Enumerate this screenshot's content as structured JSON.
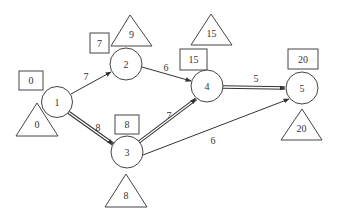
{
  "diagram": {
    "type": "activity-on-arrow network",
    "colors": {
      "line": "#333333",
      "background": "#ffffff"
    },
    "nodes": [
      {
        "id": "1",
        "label": "1",
        "cx": 57,
        "cy": 102,
        "r": 15.5,
        "early_time": "0",
        "late_time": "0",
        "box": {
          "x": 19,
          "y": 71,
          "w": 24,
          "h": 19
        },
        "tri": {
          "ax": 37,
          "ay": 103,
          "lx": 16,
          "rx": 58,
          "by": 136
        }
      },
      {
        "id": "2",
        "label": "2",
        "cx": 126,
        "cy": 64,
        "r": 16,
        "early_time": "7",
        "late_time": "9",
        "box": {
          "x": 90,
          "y": 33,
          "w": 19,
          "h": 20
        },
        "tri": {
          "ax": 130,
          "ay": 15,
          "lx": 111,
          "rx": 152,
          "by": 46
        }
      },
      {
        "id": "3",
        "label": "3",
        "cx": 127,
        "cy": 152,
        "r": 16,
        "early_time": "8",
        "late_time": "8",
        "box": {
          "x": 115,
          "y": 115,
          "w": 24,
          "h": 19
        },
        "tri": {
          "ax": 126,
          "ay": 174,
          "lx": 105,
          "rx": 147,
          "by": 207
        }
      },
      {
        "id": "4",
        "label": "4",
        "cx": 207,
        "cy": 86,
        "r": 16,
        "early_time": "15",
        "late_time": "15",
        "box": {
          "x": 180,
          "y": 49,
          "w": 27,
          "h": 21
        },
        "tri": {
          "ax": 211,
          "ay": 14,
          "lx": 191,
          "rx": 232,
          "by": 45
        }
      },
      {
        "id": "5",
        "label": "5",
        "cx": 302,
        "cy": 88,
        "r": 16,
        "early_time": "20",
        "late_time": "20",
        "box": {
          "x": 288,
          "y": 49,
          "w": 30,
          "h": 20
        },
        "tri": {
          "ax": 302,
          "ay": 109,
          "lx": 281,
          "rx": 322,
          "by": 140
        }
      }
    ],
    "edges": [
      {
        "from": "1",
        "to": "2",
        "duration": "7",
        "critical": false,
        "x1": 71,
        "y1": 94,
        "x2": 111,
        "y2": 72,
        "lx": 86,
        "ly": 80
      },
      {
        "from": "1",
        "to": "3",
        "duration": "8",
        "critical": true,
        "x1": 68,
        "y1": 112,
        "x2": 113,
        "y2": 144,
        "lx": 98,
        "ly": 131
      },
      {
        "from": "2",
        "to": "4",
        "duration": "6",
        "critical": false,
        "x1": 142,
        "y1": 67,
        "x2": 191,
        "y2": 81,
        "lx": 166,
        "ly": 71
      },
      {
        "from": "3",
        "to": "4",
        "duration": "7",
        "critical": true,
        "x1": 139,
        "y1": 142,
        "x2": 196,
        "y2": 99,
        "lx": 169,
        "ly": 119
      },
      {
        "from": "4",
        "to": "5",
        "duration": "5",
        "critical": true,
        "x1": 223,
        "y1": 87,
        "x2": 285,
        "y2": 88,
        "lx": 256,
        "ly": 82
      },
      {
        "from": "3",
        "to": "5",
        "duration": "6",
        "critical": false,
        "x1": 143,
        "y1": 155,
        "x2": 289,
        "y2": 99,
        "lx": 213,
        "ly": 144
      }
    ],
    "legend_note": "Square = earliest event time, Triangle = latest event time"
  }
}
